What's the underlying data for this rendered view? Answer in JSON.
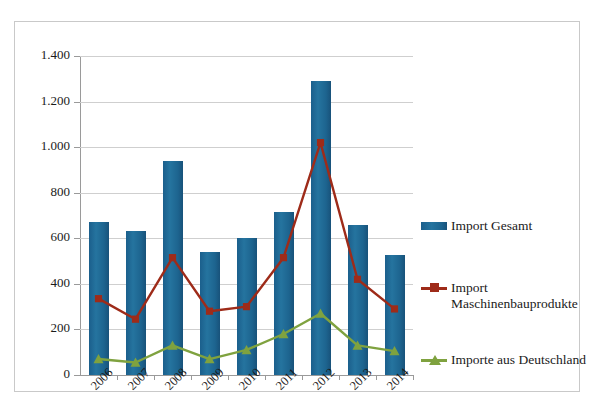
{
  "chart_data": {
    "type": "bar",
    "title": "",
    "xlabel": "",
    "ylabel": "",
    "categories": [
      "2006",
      "2007",
      "2008",
      "2009",
      "2010",
      "2011",
      "2012",
      "2013",
      "2014"
    ],
    "ylim": [
      0,
      1400
    ],
    "ytick_values": [
      0,
      200,
      400,
      600,
      800,
      1000,
      1200,
      1400
    ],
    "ytick_labels": [
      "0",
      "200",
      "400",
      "600",
      "800",
      "1.000",
      "1.200",
      "1.400"
    ],
    "grid": true,
    "legend_position": "right",
    "series": [
      {
        "name": "Import Gesamt",
        "type": "bar",
        "color": "#1f6b9c",
        "values": [
          670,
          630,
          940,
          540,
          600,
          715,
          1290,
          660,
          525
        ]
      },
      {
        "name": "Import Maschinenbauprodukte",
        "type": "line",
        "color": "#9e2b19",
        "marker": "square",
        "values": [
          335,
          245,
          515,
          280,
          300,
          515,
          1020,
          420,
          290
        ]
      },
      {
        "name": "Importe aus Deutschland",
        "type": "line",
        "color": "#7fa23f",
        "marker": "triangle",
        "values": [
          70,
          55,
          130,
          70,
          110,
          180,
          270,
          130,
          105
        ]
      }
    ]
  },
  "legend": {
    "entries": [
      {
        "label": "Import Gesamt",
        "icon": "bar-swatch-icon"
      },
      {
        "label": "Import",
        "label2": "Maschinenbauprodukte",
        "icon": "line-square-marker-icon"
      },
      {
        "label": "Importe aus Deutschland",
        "icon": "line-triangle-marker-icon"
      }
    ]
  }
}
